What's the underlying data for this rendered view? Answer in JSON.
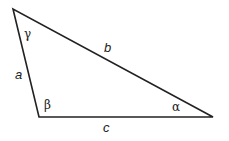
{
  "diagram": {
    "type": "triangle",
    "stroke_color": "#222222",
    "background": "#ffffff",
    "vertices": {
      "top": {
        "x": 13,
        "y": 9,
        "angle_label": "γ"
      },
      "bottom_left": {
        "x": 39,
        "y": 117,
        "angle_label": "β"
      },
      "right": {
        "x": 213,
        "y": 117,
        "angle_label": "α"
      }
    },
    "sides": {
      "a": {
        "label": "a",
        "between": [
          "top",
          "bottom_left"
        ]
      },
      "b": {
        "label": "b",
        "between": [
          "top",
          "right"
        ]
      },
      "c": {
        "label": "c",
        "between": [
          "bottom_left",
          "right"
        ]
      }
    },
    "angles": {
      "gamma": "γ",
      "beta": "β",
      "alpha": "α"
    }
  }
}
